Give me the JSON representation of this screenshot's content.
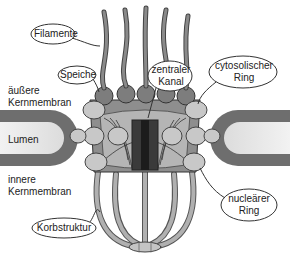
{
  "diagram": {
    "labels": {
      "filamente": "Filamente",
      "speiche": "Speiche",
      "zentraler_kanal_line1": "zentraler",
      "zentraler_kanal_line2": "Kanal",
      "cytosolischer_ring_line1": "cytosolischer",
      "cytosolischer_ring_line2": "Ring",
      "aeussere_kernmembran_line1": "äußere",
      "aeussere_kernmembran_line2": "Kernmembran",
      "lumen": "Lumen",
      "innere_kernmembran_line1": "innere",
      "innere_kernmembran_line2": "Kernmembran",
      "korbstruktur": "Korbstruktur",
      "nuclearer_ring_line1": "nucleärer",
      "nuclearer_ring_line2": "Ring"
    },
    "colors": {
      "membrane": "#6b6b6b",
      "lumen": "#e8e8e8",
      "ring_dark": "#7a7a7a",
      "ring_light": "#c4c4c4",
      "channel": "#2a2a2a",
      "basket": "#a8a8a8",
      "outline": "#333333"
    }
  }
}
